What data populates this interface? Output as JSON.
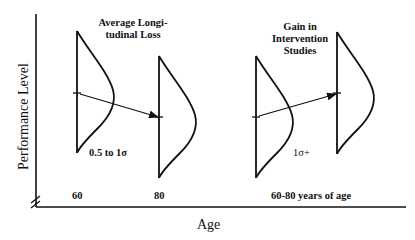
{
  "diagram": {
    "y_axis_label": "Performance Level",
    "x_axis_label": "Age",
    "x_ticks": [
      "60",
      "80",
      "60-80 years of age"
    ],
    "left_panel": {
      "title_line1": "Average Longi-",
      "title_line2": "tudinal Loss",
      "effect_label": "0.5 to 1σ",
      "from_age": "60",
      "to_age": "80",
      "direction": "decline"
    },
    "right_panel": {
      "title_line1": "Gain in",
      "title_line2": "Intervention",
      "title_line3": "Studies",
      "effect_label": "1σ+",
      "direction": "gain"
    },
    "colors": {
      "ink": "#111111",
      "background": "#ffffff"
    }
  }
}
